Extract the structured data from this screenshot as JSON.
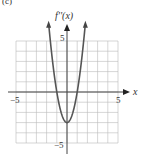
{
  "panel_label": "(c)",
  "chart_data": {
    "type": "line",
    "title": "",
    "xlabel": "x",
    "ylabel": "f''(x)",
    "xlim": [
      -5,
      5
    ],
    "ylim": [
      -5,
      5
    ],
    "grid": true,
    "x_ticks_labeled": [
      "-5",
      "5"
    ],
    "y_ticks_labeled": [
      "5",
      "-5"
    ],
    "function": "f''(x) = 3x^2 - 3",
    "series": [
      {
        "name": "f''(x)",
        "x": [
          -1.8,
          -1.5,
          -1,
          -0.5,
          0,
          0.5,
          1,
          1.5,
          1.8
        ],
        "values": [
          6.7,
          3.75,
          0,
          -2.25,
          -3,
          -2.25,
          0,
          3.75,
          6.7
        ]
      }
    ]
  },
  "labels": {
    "y_axis": "f''(x)",
    "x_axis": "x",
    "x_min": "−5",
    "x_max": "5",
    "y_max": "5",
    "y_min": "−5"
  }
}
